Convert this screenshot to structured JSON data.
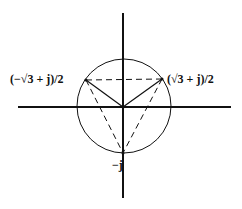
{
  "diagram": {
    "type": "complex-plane",
    "colors": {
      "stroke": "#111111",
      "background": "#ffffff"
    },
    "axes": {
      "horizontal": {
        "x1": 18,
        "y1": 107,
        "x2": 231,
        "y2": 107,
        "stroke_width": 2
      },
      "vertical": {
        "x1": 123,
        "y1": 13,
        "x2": 123,
        "y2": 198,
        "stroke_width": 2
      }
    },
    "circle": {
      "cx": 124,
      "cy": 106,
      "r": 47,
      "stroke_width": 1
    },
    "origin": {
      "x": 123,
      "y": 107
    },
    "points": [
      {
        "id": "left",
        "label": "(−√3 + j)/2",
        "x": 86,
        "y": 80,
        "label_x": 10,
        "label_y": 83
      },
      {
        "id": "right",
        "label": "(√3 + j)/2",
        "x": 162,
        "y": 79,
        "label_x": 167,
        "label_y": 83
      },
      {
        "id": "bottom",
        "label": "−j",
        "x": 123,
        "y": 153,
        "label_x": 112,
        "label_y": 169
      }
    ],
    "solid_spokes": [
      "left",
      "right"
    ],
    "dashed_triangle": [
      "left",
      "right",
      "bottom"
    ]
  }
}
